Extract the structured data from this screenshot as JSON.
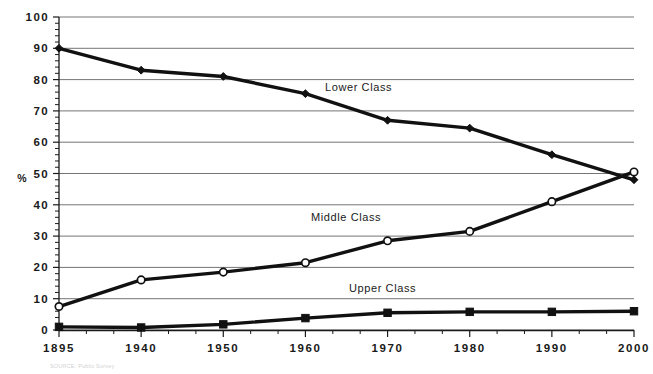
{
  "chart_data": {
    "type": "line",
    "title": "",
    "xlabel": "",
    "ylabel": "%",
    "ylim": [
      0,
      100
    ],
    "ytick_step": 10,
    "grid": true,
    "legend_position": "inline-annotations",
    "categories": [
      "1895",
      "1940",
      "1950",
      "1960",
      "1970",
      "1980",
      "1990",
      "2000"
    ],
    "yticks": [
      "0",
      "10",
      "20",
      "30",
      "40",
      "50",
      "60",
      "70",
      "80",
      "90",
      "100"
    ],
    "series": [
      {
        "name": "Lower Class",
        "marker": "filled-diamond",
        "color": "#111111",
        "values": [
          90,
          83,
          81,
          75.5,
          67,
          64.5,
          56,
          48
        ]
      },
      {
        "name": "Middle Class",
        "marker": "open-circle",
        "color": "#111111",
        "values": [
          7.5,
          16,
          18.5,
          21.5,
          28.5,
          31.5,
          41,
          50.5
        ]
      },
      {
        "name": "Upper Class",
        "marker": "filled-square",
        "color": "#111111",
        "values": [
          1,
          0.8,
          1.8,
          3.8,
          5.5,
          5.8,
          5.8,
          6
        ]
      }
    ],
    "annotations": [
      {
        "text": "Lower Class",
        "x": 325,
        "y": 91
      },
      {
        "text": "Middle Class",
        "x": 311,
        "y": 221
      },
      {
        "text": "Upper Class",
        "x": 349,
        "y": 292
      }
    ],
    "source_note": "SOURCE: Public Survey"
  },
  "axis": {
    "unit_label": "%"
  }
}
